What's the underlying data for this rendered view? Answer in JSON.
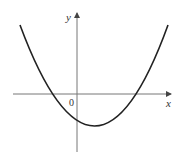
{
  "figure": {
    "type": "parabola graph",
    "axes": {
      "x_label": "x",
      "y_label": "y",
      "origin_label": "0",
      "axis_color": "#666666"
    },
    "curve": {
      "description": "upward-opening parabola with vertex right of origin below x-axis, crossing x-axis at one negative and one positive root, y-intercept negative",
      "color": "#222222"
    }
  }
}
